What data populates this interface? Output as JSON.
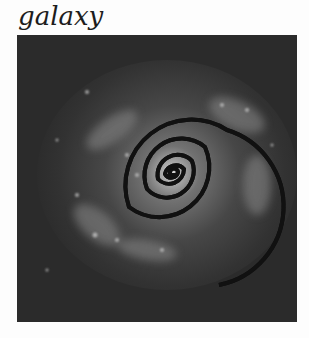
{
  "title": "galaxy",
  "image": {
    "description": "grayscale spiral galaxy with overlaid white spiral curve",
    "background_color": "#2a2a2a",
    "overlay_color": "#f2f2f2",
    "spiral": {
      "center": [
        155,
        138
      ],
      "turns": 4.3
    }
  }
}
